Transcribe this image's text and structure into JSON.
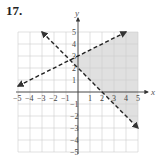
{
  "problem": {
    "number": "17."
  },
  "chart_data": {
    "type": "line",
    "title": "",
    "xlabel": "x",
    "ylabel": "y",
    "xlim": [
      -5,
      5
    ],
    "ylim": [
      -5,
      5
    ],
    "grid": true,
    "x_ticks": [
      "-5",
      "-4",
      "-3",
      "-2",
      "-1",
      "1",
      "2",
      "3",
      "4",
      "5"
    ],
    "y_ticks": [
      "5",
      "4",
      "3",
      "2",
      "1",
      "-1",
      "-2",
      "-3",
      "-4",
      "-5"
    ],
    "series": [
      {
        "name": "boundary 1",
        "equation": "y = 0.5x + 3",
        "style": "dashed",
        "arrows": "both",
        "points": [
          [
            -5,
            0.5
          ],
          [
            4,
            5
          ]
        ]
      },
      {
        "name": "boundary 2",
        "equation": "y = -x + 2",
        "style": "dashed",
        "arrows": "both",
        "points": [
          [
            -3,
            5
          ],
          [
            5,
            -3
          ]
        ]
      }
    ],
    "shaded_region": {
      "description": "y < 0.5x + 3 and y > -x + 2",
      "vertices": [
        [
          -0.667,
          2.667
        ],
        [
          4,
          5
        ],
        [
          5,
          5
        ],
        [
          5,
          -3
        ]
      ],
      "color": "#e0e0e0"
    },
    "intersection": [
      -0.667,
      2.667
    ]
  }
}
